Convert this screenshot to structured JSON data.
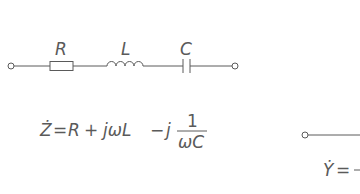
{
  "colors": {
    "stroke": "#5a5a5a",
    "text": "#5a5a5a",
    "background": "#ffffff"
  },
  "circuit_left": {
    "type": "series RLC",
    "components": [
      {
        "id": "resistor",
        "symbol": "rectangle",
        "label": "R"
      },
      {
        "id": "inductor",
        "symbol": "coil",
        "label": "L"
      },
      {
        "id": "capacitor",
        "symbol": "parallel-plates",
        "label": "C"
      }
    ],
    "terminals": [
      "left-terminal",
      "right-terminal"
    ]
  },
  "equation_left": {
    "lhs": "Ż",
    "eq": "=",
    "t1": "R",
    "plus": "+",
    "t2": "jωL",
    "minus": "−",
    "t3": "j",
    "frac_num": "1",
    "frac_den": "ωC"
  },
  "circuit_right_partial": {
    "terminals": [
      "left-terminal"
    ]
  },
  "equation_right_partial": {
    "lhs": "Ẏ",
    "eq": "=",
    "cut": "-"
  }
}
